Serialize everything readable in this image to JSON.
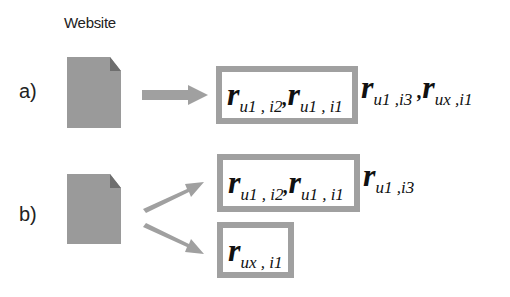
{
  "header": {
    "title": "Website"
  },
  "rows": [
    {
      "label": "a)",
      "boxes": [
        {
          "terms": [
            {
              "r": "r",
              "sub": "u1 , i2",
              "sep": ","
            },
            {
              "r": "r",
              "sub": "u1 , i1",
              "sep": ""
            }
          ]
        }
      ],
      "outside": [
        {
          "r": "r",
          "sub": "u1 ,i3",
          "sep": " ,"
        },
        {
          "r": "r",
          "sub": "ux ,i1",
          "sep": ""
        }
      ]
    },
    {
      "label": "b)",
      "boxes": [
        {
          "terms": [
            {
              "r": "r",
              "sub": "u1 , i2",
              "sep": ","
            },
            {
              "r": "r",
              "sub": "u1 , i1",
              "sep": ""
            }
          ]
        },
        {
          "terms": [
            {
              "r": "r",
              "sub": "ux , i1",
              "sep": ""
            }
          ]
        }
      ],
      "outside": [
        {
          "r": "r",
          "sub": "u1 ,i3",
          "sep": ""
        }
      ]
    }
  ],
  "colors": {
    "document": "#9a9a9a",
    "arrow": "#a0a0a0",
    "box_border": "#a0a0a0"
  }
}
